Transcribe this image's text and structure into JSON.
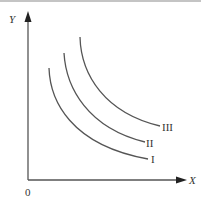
{
  "diagram": {
    "type": "indifference-curves",
    "axes": {
      "y_label": "Y",
      "x_label": "X",
      "origin_label": "0"
    },
    "curves": [
      {
        "label": "I"
      },
      {
        "label": "II"
      },
      {
        "label": "III"
      }
    ],
    "colors": {
      "line": "#444444",
      "border": "#aaaaaa",
      "background": "#ffffff"
    }
  }
}
